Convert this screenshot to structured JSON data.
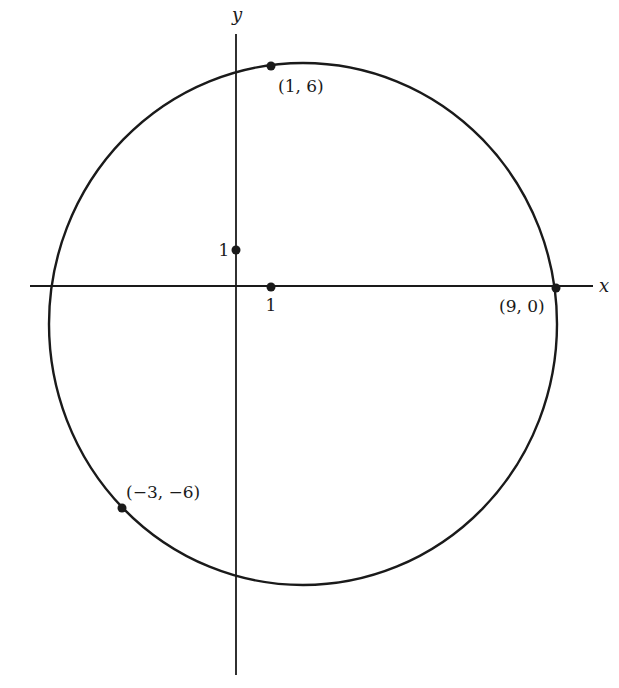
{
  "diagram": {
    "type": "circle-through-three-points",
    "colors": {
      "ink": "#1a1a1a",
      "background": "#ffffff"
    },
    "axes": {
      "x_label": "x",
      "y_label": "y",
      "tick_x_label": "1",
      "tick_y_label": "1"
    },
    "circle": {
      "center": [
        2,
        -1
      ],
      "radius_squared": 50
    },
    "points": [
      {
        "label": "(1,  6)",
        "coords": [
          1,
          6
        ]
      },
      {
        "label": "(9,  0)",
        "coords": [
          9,
          0
        ]
      },
      {
        "label": "(−3,  −6)",
        "coords": [
          -3,
          -6
        ]
      },
      {
        "label": "1",
        "coords": [
          0,
          1
        ]
      },
      {
        "label": "1",
        "coords": [
          1,
          0
        ]
      }
    ]
  }
}
